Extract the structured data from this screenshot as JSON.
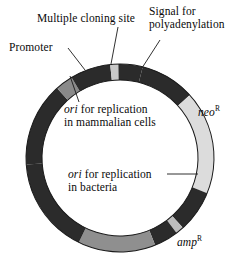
{
  "figure": {
    "kind": "plasmid-map"
  },
  "colors": {
    "backbone": "#2b2b2b",
    "promoter": "#8a8a8a",
    "mcs": "#c9c9c9",
    "polya": "#2b2b2b",
    "neo": "#dcdcdc",
    "ori_bacteria": "#bdbdbd",
    "amp": "#8f8f8f",
    "background": "#ffffff",
    "outline": "#1a1a1a",
    "leader": "#1a1a1a"
  },
  "ring": {
    "center_x": 120,
    "center_y": 158,
    "outer_radius": 94,
    "inner_radius": 78
  },
  "segments": [
    {
      "id": "backbone",
      "name": "backbone",
      "color_key": "backbone",
      "start_deg": -180,
      "end_deg": -128
    },
    {
      "id": "promoter",
      "name": "Promoter",
      "color_key": "promoter",
      "start_deg": -128,
      "end_deg": -117
    },
    {
      "id": "backbone2",
      "name": "backbone",
      "color_key": "backbone",
      "start_deg": -117,
      "end_deg": -92
    },
    {
      "id": "mcs",
      "name": "Multiple cloning site",
      "color_key": "mcs",
      "start_deg": -92,
      "end_deg": -87
    },
    {
      "id": "backbone3",
      "name": "backbone",
      "color_key": "backbone",
      "start_deg": -87,
      "end_deg": -72
    },
    {
      "id": "polya",
      "name": "Signal for polyadenylation",
      "color_key": "polya",
      "start_deg": -72,
      "end_deg": -38
    },
    {
      "id": "neo",
      "name": "neoR",
      "color_key": "neo",
      "start_deg": -38,
      "end_deg": 26
    },
    {
      "id": "backbone4",
      "name": "backbone",
      "color_key": "backbone",
      "start_deg": 26,
      "end_deg": 52
    },
    {
      "id": "ori_bacteria",
      "name": "ori for replication in bacteria",
      "color_key": "ori_bacteria",
      "start_deg": 52,
      "end_deg": 57
    },
    {
      "id": "backbone5",
      "name": "backbone",
      "color_key": "backbone",
      "start_deg": 57,
      "end_deg": 72
    },
    {
      "id": "amp",
      "name": "ampR",
      "color_key": "amp",
      "start_deg": 72,
      "end_deg": 120
    },
    {
      "id": "backbone6",
      "name": "backbone",
      "color_key": "backbone",
      "start_deg": 120,
      "end_deg": 180
    }
  ],
  "labels": {
    "mcs": "Multiple cloning site",
    "signal_line1": "Signal for",
    "signal_line2": "polyadenylation",
    "promoter": "Promoter",
    "ori_mammalian_italic": "ori",
    "ori_mammalian_rest": " for replication",
    "ori_mammalian_line2": "in mammalian cells",
    "ori_bacteria_italic": "ori",
    "ori_bacteria_rest": " for replication",
    "ori_bacteria_line2": "in bacteria",
    "neo": "neo",
    "neo_sup": "R",
    "amp": "amp",
    "amp_sup": "R"
  },
  "leaders": [
    {
      "id": "mcs",
      "name": "leader-line-mcs",
      "x1": 118,
      "y1": 27,
      "x2": 111,
      "y2": 64
    },
    {
      "id": "signal",
      "name": "leader-line-signal",
      "x1": 160,
      "y1": 40,
      "x2": 142,
      "y2": 68
    },
    {
      "id": "promoter",
      "name": "leader-line-promoter",
      "x1": 68,
      "y1": 48,
      "x2": 85,
      "y2": 70
    },
    {
      "id": "ori-mam",
      "name": "leader-line-ori-mammalian",
      "x1": 79,
      "y1": 102,
      "x2": 70,
      "y2": 76
    },
    {
      "id": "ori-bac",
      "name": "leader-line-ori-bacteria",
      "x1": 167,
      "y1": 174,
      "x2": 198,
      "y2": 174
    }
  ]
}
